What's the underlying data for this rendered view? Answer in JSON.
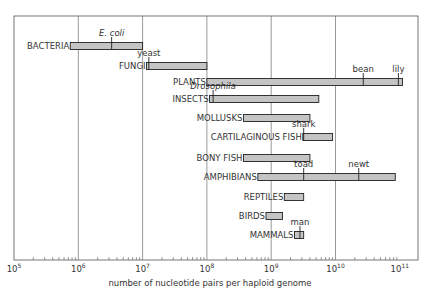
{
  "chart_data": {
    "type": "bar",
    "subtype": "horizontal-range-log",
    "title": "",
    "xlabel": "number of nucleotide pairs per haploid genome",
    "ylabel": "",
    "xscale": "log",
    "xlim": [
      100000,
      100000000000
    ],
    "grid": "vertical-major",
    "x_ticks": [
      {
        "base": "10",
        "exp": "5",
        "value": 100000
      },
      {
        "base": "10",
        "exp": "6",
        "value": 1000000
      },
      {
        "base": "10",
        "exp": "7",
        "value": 10000000
      },
      {
        "base": "10",
        "exp": "8",
        "value": 100000000
      },
      {
        "base": "10",
        "exp": "9",
        "value": 1000000000
      },
      {
        "base": "10",
        "exp": "10",
        "value": 10000000000
      },
      {
        "base": "10",
        "exp": "11",
        "value": 100000000000
      }
    ],
    "categories": [
      "BACTERIA",
      "FUNGI",
      "PLANTS",
      "INSECTS",
      "MOLLUSKS",
      "CARTILAGINOUS FISH",
      "BONY FISH",
      "AMPHIBIANS",
      "REPTILES",
      "BIRDS",
      "MAMMALS"
    ],
    "series": [
      {
        "name": "BACTERIA",
        "min": 750000,
        "max": 10000000,
        "markers": [
          {
            "label": "E. coli",
            "value": 3300000,
            "italic": true
          }
        ]
      },
      {
        "name": "FUNGI",
        "min": 11500000,
        "max": 100000000,
        "markers": [
          {
            "label": "yeast",
            "value": 12500000,
            "italic": false
          }
        ]
      },
      {
        "name": "PLANTS",
        "min": 100000000,
        "max": 110000000000,
        "markers": [
          {
            "label": "bean",
            "value": 27000000000,
            "italic": false
          },
          {
            "label": "lily",
            "value": 95000000000,
            "italic": false
          }
        ]
      },
      {
        "name": "INSECTS",
        "min": 110000000,
        "max": 5500000000,
        "markers": [
          {
            "label": "Drosophila",
            "value": 125000000,
            "italic": true
          }
        ]
      },
      {
        "name": "MOLLUSKS",
        "min": 370000000,
        "max": 4000000000,
        "markers": []
      },
      {
        "name": "CARTILAGINOUS FISH",
        "min": 3100000000,
        "max": 9000000000,
        "markers": [
          {
            "label": "shark",
            "value": 3200000000,
            "italic": false
          }
        ]
      },
      {
        "name": "BONY FISH",
        "min": 370000000,
        "max": 4000000000,
        "markers": []
      },
      {
        "name": "AMPHIBIANS",
        "min": 620000000,
        "max": 85000000000,
        "markers": [
          {
            "label": "toad",
            "value": 3200000000,
            "italic": false
          },
          {
            "label": "newt",
            "value": 23000000000,
            "italic": false
          }
        ]
      },
      {
        "name": "REPTILES",
        "min": 1600000000,
        "max": 3200000000,
        "markers": []
      },
      {
        "name": "BIRDS",
        "min": 830000000,
        "max": 1500000000,
        "markers": []
      },
      {
        "name": "MAMMALS",
        "min": 2300000000,
        "max": 3200000000,
        "markers": [
          {
            "label": "man",
            "value": 2800000000,
            "italic": false
          }
        ]
      }
    ]
  },
  "colors": {
    "bar_fill": "#c4c4c4",
    "bar_stroke": "#222222",
    "grid": "#555555",
    "frame": "#555555",
    "text": "#333333"
  }
}
